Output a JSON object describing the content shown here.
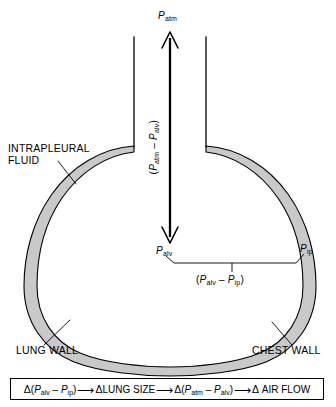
{
  "figure": {
    "type": "anatomical-schematic",
    "background_color": "#ffffff",
    "line_color": "#000000",
    "pleural_fluid_fill": "#c9c9c9"
  },
  "labels": {
    "p_atm": {
      "base": "P",
      "sub": "atm"
    },
    "p_alv": {
      "base": "P",
      "sub": "alv"
    },
    "p_ip": {
      "base": "P",
      "sub": "ip"
    },
    "transairway": {
      "open": "(",
      "first_base": "P",
      "first_sub": "atm",
      "minus": " – ",
      "second_base": "P",
      "second_sub": "alv",
      "close": ")"
    },
    "transpulmonary": {
      "open": "(",
      "first_base": "P",
      "first_sub": "alv",
      "minus": " – ",
      "second_base": "P",
      "second_sub": "ip",
      "close": ")"
    },
    "intrapleural_fluid_line1": "INTRAPLEURAL",
    "intrapleural_fluid_line2": "FLUID",
    "lung_wall": "LUNG WALL",
    "chest_wall": "CHEST WALL"
  },
  "formula": {
    "delta": "Δ",
    "arrow": "⟶",
    "term1": {
      "open": "(",
      "a_base": "P",
      "a_sub": "alv",
      "minus": " – ",
      "b_base": "P",
      "b_sub": "ip",
      "close": ")"
    },
    "term2": "LUNG SIZE",
    "term3": {
      "open": "(",
      "a_base": "P",
      "a_sub": "atm",
      "minus": " – ",
      "b_base": "P",
      "b_sub": "alv",
      "close": ")"
    },
    "term4": "AIR FLOW"
  }
}
